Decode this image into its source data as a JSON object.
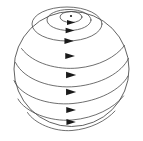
{
  "figure": {
    "type": "vector-diagram",
    "background_color": "#ffffff",
    "width": 143,
    "height": 141
  },
  "sphere": {
    "name": "sphere-outline",
    "center_x": 71.5,
    "center_y": 69,
    "radius": 57.5,
    "stroke_color": "#3a3a3a",
    "stroke_width": 0.8
  },
  "pole": {
    "name": "north-pole-dot",
    "cx": 71,
    "cy": 16,
    "r": 1.1,
    "color": "#1a1a1a"
  },
  "flow_lines": [
    {
      "id": "latitude-1",
      "closed": true,
      "cx": 71,
      "cy": 17,
      "rx": 11,
      "ry": 5.5,
      "arrow_x": 71,
      "arrow_y": 22.5,
      "arrow_size": 4.2
    },
    {
      "id": "latitude-2",
      "closed": true,
      "cx": 69,
      "cy": 20,
      "rx": 22,
      "ry": 10.5,
      "arrow_x": 70,
      "arrow_y": 30.5,
      "arrow_size": 4.6
    },
    {
      "id": "latitude-3",
      "closed": true,
      "cx": 67,
      "cy": 24,
      "rx": 35,
      "ry": 17,
      "arrow_x": 69,
      "arrow_y": 41,
      "arrow_size": 4.8
    },
    {
      "id": "latitude-4",
      "closed": false,
      "arrow_x": 70,
      "arrow_y": 56,
      "arrow_size": 5.0
    },
    {
      "id": "latitude-5",
      "closed": false,
      "arrow_x": 71,
      "arrow_y": 75,
      "arrow_size": 5.2
    },
    {
      "id": "latitude-6",
      "closed": false,
      "arrow_x": 71,
      "arrow_y": 92,
      "arrow_size": 5.2
    },
    {
      "id": "latitude-7",
      "closed": false,
      "arrow_x": 71,
      "arrow_y": 110,
      "arrow_size": 5.0
    },
    {
      "id": "latitude-8",
      "closed": false,
      "arrow_x": 71,
      "arrow_y": 122,
      "arrow_size": 4.8
    }
  ],
  "arc_paths": {
    "latitude-4": "M 21.5 48.5 C 33 64 58 70 78 68 C 99 66 116 57 124.5 45.5",
    "latitude-5": "M 15.5 62.5 C 24 80 52 89 76 86.5 C 101 84 121.5 73 128.5 58.5",
    "latitude-6": "M 14 80.5 C 20 96 48 106 73 103.5 C 99 101 120.5 90 128 76",
    "latitude-7": "M 18 99 C 25 112 50 122 72 120 C 95 118 114 108 123.5 96",
    "latitude-8": "M 27.5 112.5 C 34 123 54 132 72 130.5 C 90 129 106 121 115 111"
  },
  "style": {
    "line_color": "#4a4a4a",
    "arrow_color": "#1a1a1a",
    "outline_color": "#3a3a3a"
  }
}
